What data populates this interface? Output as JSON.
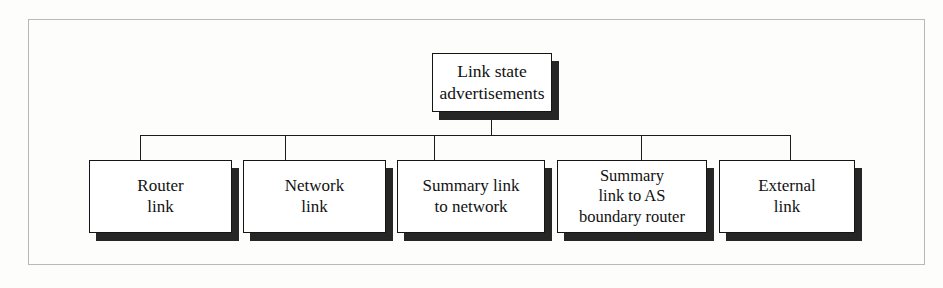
{
  "figure": {
    "type": "hierarchy-tree",
    "orientation": "top-down",
    "background_color": "#fdfdfb",
    "frame_color": "#b9b9b9",
    "node_fill": "#ffffff",
    "node_border_color": "#151515",
    "node_shadow_color": "#262626",
    "connector_color": "#1b1b1b",
    "text_color": "#111111"
  },
  "root": {
    "id": "link-state-advertisements",
    "label": "Link state\nadvertisements",
    "x": 432,
    "y": 53,
    "width": 120,
    "height": 59
  },
  "connectors": {
    "stem_x": 491,
    "stem_top": 112,
    "bus_y": 135,
    "bus_left": 140,
    "bus_right": 790,
    "drop_bottom": 160,
    "drop_x_values": [
      140,
      285,
      434,
      641,
      790
    ]
  },
  "children": [
    {
      "id": "router-link",
      "label": "Router\nlink",
      "x": 89,
      "y": 160,
      "width": 143,
      "height": 73,
      "connector_x": 140
    },
    {
      "id": "network-link",
      "label": "Network\nlink",
      "x": 243,
      "y": 160,
      "width": 143,
      "height": 73,
      "connector_x": 285
    },
    {
      "id": "summary-link-to-network",
      "label": "Summary link\nto network",
      "x": 397,
      "y": 160,
      "width": 148,
      "height": 73,
      "connector_x": 434
    },
    {
      "id": "summary-link-to-as-boundary-router",
      "label": "Summary\nlink to AS\nboundary router",
      "x": 557,
      "y": 160,
      "width": 150,
      "height": 73,
      "connector_x": 641
    },
    {
      "id": "external-link",
      "label": "External\nlink",
      "x": 719,
      "y": 160,
      "width": 136,
      "height": 73,
      "connector_x": 790
    }
  ]
}
